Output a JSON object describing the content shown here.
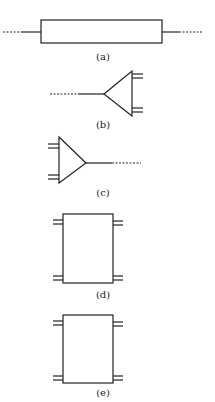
{
  "figures": [
    {
      "id": "a",
      "label": "(a)",
      "shape": "rectangle-two-terminal"
    },
    {
      "id": "b",
      "label": "(b)",
      "shape": "triangle-left-apex-right-ports"
    },
    {
      "id": "c",
      "label": "(c)",
      "shape": "triangle-right-apex-left-ports"
    },
    {
      "id": "d",
      "label": "(d)",
      "shape": "rectangle-four-port"
    },
    {
      "id": "e",
      "label": "(e)",
      "shape": "rectangle-four-port"
    }
  ],
  "colors": {
    "stroke": "#222222",
    "background": "#ffffff"
  }
}
